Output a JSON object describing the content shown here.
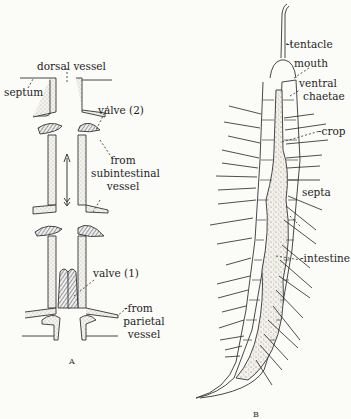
{
  "figure": {
    "panel_a": {
      "letter": "A",
      "labels": {
        "dorsal_vessel": "dorsal vessel",
        "septum": "septum",
        "valve_2": "valve  (2)",
        "from_subintestinal_1": "from",
        "from_subintestinal_2": "subintestinal",
        "from_subintestinal_3": "vessel",
        "valve_1": "valve (1)",
        "from_parietal_1": "-from",
        "from_parietal_2": "parietal",
        "from_parietal_3": "vessel"
      }
    },
    "panel_b": {
      "letter": "B",
      "labels": {
        "tentacle": "-tentacle",
        "mouth": "mouth",
        "ventral_chaetae_1": "ventral",
        "ventral_chaetae_2": "chaetae",
        "crop": "-crop",
        "septa": "septa",
        "intestine": "-intestine"
      }
    }
  }
}
